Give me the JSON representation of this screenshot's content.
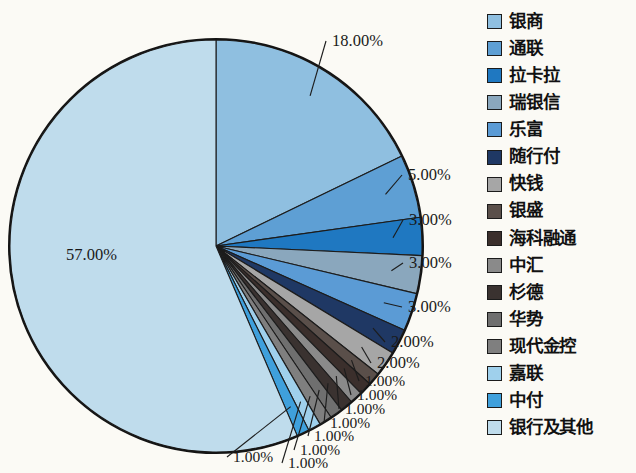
{
  "chart_data": {
    "type": "pie",
    "title": "",
    "legend_position": "right",
    "labels": [
      "银商",
      "通联",
      "拉卡拉",
      "瑞银信",
      "乐富",
      "随行付",
      "快钱",
      "银盛",
      "海科融通",
      "中汇",
      "杉德",
      "华势",
      "现代金控",
      "嘉联",
      "中付",
      "银行及其他"
    ],
    "values": [
      18,
      5,
      3,
      3,
      3,
      2,
      2,
      1,
      1,
      1,
      1,
      1,
      1,
      1,
      1,
      57
    ],
    "value_labels": [
      "18.00%",
      "5.00%",
      "3.00%",
      "3.00%",
      "3.00%",
      "2.00%",
      "2.00%",
      "1.00%",
      "1.00%",
      "1.00%",
      "1.00%",
      "1.00%",
      "1.00%",
      "1.00%",
      "1.00%",
      "57.00%"
    ],
    "colors": [
      "#8fbfe0",
      "#5e9fd4",
      "#1f78c1",
      "#8aa7bd",
      "#5b9bd5",
      "#1f3864",
      "#a6a6a6",
      "#5a4f4a",
      "#3b2f2c",
      "#8a8a8a",
      "#3a3230",
      "#6f6f6f",
      "#7f7f7f",
      "#9fd0ec",
      "#3fa0dc",
      "#bfdcec"
    ],
    "units": "%",
    "total": 100
  },
  "legend": {
    "items": [
      {
        "label": "银商",
        "color": "#8fbfe0"
      },
      {
        "label": "通联",
        "color": "#5e9fd4"
      },
      {
        "label": "拉卡拉",
        "color": "#1f78c1"
      },
      {
        "label": "瑞银信",
        "color": "#8aa7bd"
      },
      {
        "label": "乐富",
        "color": "#5b9bd5"
      },
      {
        "label": "随行付",
        "color": "#1f3864"
      },
      {
        "label": "快钱",
        "color": "#a6a6a6"
      },
      {
        "label": "银盛",
        "color": "#5a4f4a"
      },
      {
        "label": "海科融通",
        "color": "#3b2f2c"
      },
      {
        "label": "中汇",
        "color": "#8a8a8a"
      },
      {
        "label": "杉德",
        "color": "#3a3230"
      },
      {
        "label": "华势",
        "color": "#6f6f6f"
      },
      {
        "label": "现代金控",
        "color": "#7f7f7f"
      },
      {
        "label": "嘉联",
        "color": "#9fd0ec"
      },
      {
        "label": "中付",
        "color": "#3fa0dc"
      },
      {
        "label": "银行及其他",
        "color": "#bfdcec"
      }
    ]
  },
  "callouts": [
    {
      "text": "18.00%"
    },
    {
      "text": "5.00%"
    },
    {
      "text": "3.00%"
    },
    {
      "text": "3.00%"
    },
    {
      "text": "3.00%"
    },
    {
      "text": "2.00%"
    },
    {
      "text": "2.00%"
    },
    {
      "text": "1.00%"
    },
    {
      "text": "1.00%"
    },
    {
      "text": "1.00%"
    },
    {
      "text": "1.00%"
    },
    {
      "text": "1.00%"
    },
    {
      "text": "1.00%"
    },
    {
      "text": "1.00%"
    },
    {
      "text": "1.00%"
    },
    {
      "text": "57.00%"
    }
  ]
}
